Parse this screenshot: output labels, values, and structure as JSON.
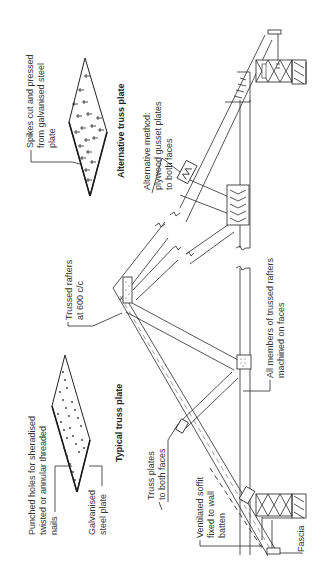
{
  "diagram": {
    "orientation": "rotated 90 degrees counter-clockwise",
    "plate_titles": {
      "alternative": "Alternative truss plate",
      "typical": "Typical truss plate"
    },
    "labels": {
      "spikes": [
        "Spikes cut and pressed",
        "from galvanised steel",
        "plate"
      ],
      "alt_method": [
        "Alternative method:",
        "plywood gusset plates",
        "to both faces"
      ],
      "trussed_rafters": [
        "Trussed rafters",
        "at 600 c/c"
      ],
      "all_members": [
        "All members of trussed rafters",
        "machined on faces"
      ],
      "punched_holes": [
        "Punched holes for sheradised",
        "twisted or annular threaded",
        "nails"
      ],
      "galvanised": [
        "Galvanised",
        "steel plate"
      ],
      "truss_plates": [
        "Truss plates",
        "to both faces"
      ],
      "soffit": [
        "Ventilated soffit",
        "fixed to wall",
        "batten"
      ],
      "fascia": "Fascia"
    }
  }
}
